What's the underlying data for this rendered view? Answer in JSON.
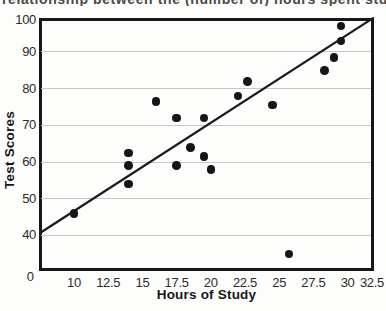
{
  "caption_fragment": "relationship between the (number of) hours spent studying and the grades on the big exam",
  "chart_data": {
    "type": "scatter",
    "title": "",
    "xlabel": "Hours of Study",
    "ylabel": "Test Scores",
    "origin_label": "0",
    "x_ticks": [
      10,
      12.5,
      15,
      17.5,
      20,
      22.5,
      25,
      27.5,
      30,
      32.5
    ],
    "y_ticks": [
      100,
      90,
      80,
      70,
      60,
      50,
      40
    ],
    "grid_values": [
      90,
      80,
      70,
      60,
      50,
      40
    ],
    "x_axis_visible_range": [
      7.5,
      32.2
    ],
    "y_axis_visible_range": [
      30.5,
      100
    ],
    "grid": "horizontal only",
    "points": [
      [
        10,
        46
      ],
      [
        14,
        54
      ],
      [
        14,
        59
      ],
      [
        14,
        62.5
      ],
      [
        16,
        76.5
      ],
      [
        17.5,
        59
      ],
      [
        17.5,
        72
      ],
      [
        18.5,
        64
      ],
      [
        19.5,
        61.5
      ],
      [
        19.5,
        72
      ],
      [
        20,
        58
      ],
      [
        22,
        78
      ],
      [
        22.7,
        82
      ],
      [
        24.5,
        75.5
      ],
      [
        25.7,
        35
      ],
      [
        28.3,
        85
      ],
      [
        29,
        88.5
      ],
      [
        29.5,
        93
      ],
      [
        29.5,
        97
      ]
    ],
    "trendline": {
      "x1": 7.57,
      "y1": 40.8,
      "x2": 31.86,
      "y2": 99.2
    },
    "colors": {
      "points": "#161616",
      "trendline": "#1c1c1c",
      "grid": "#c6c6c6",
      "frame": "#171717",
      "labels": "#2b2b2b"
    }
  }
}
